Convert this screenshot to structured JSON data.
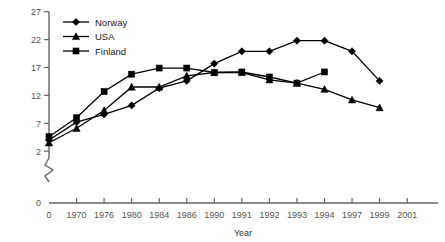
{
  "chart_data": {
    "type": "line",
    "title": "",
    "xlabel": "Year",
    "ylabel": "",
    "grid": false,
    "legend_position": "top-left-inside",
    "x_tick_labels": [
      "0",
      "1970",
      "1976",
      "1980",
      "1984",
      "1986",
      "1990",
      "1991",
      "1992",
      "1993",
      "1994",
      "1997",
      "1999",
      "2001"
    ],
    "y_tick_labels": [
      "0",
      "2",
      "7",
      "12",
      "17",
      "22",
      "27"
    ],
    "ylim": [
      2,
      27
    ],
    "y_axis_break": true,
    "y_axis_break_note": "axis broken between 0 and 2",
    "categories": [
      "1970",
      "1976",
      "1980",
      "1984",
      "1986",
      "1990",
      "1991",
      "1992",
      "1993",
      "1994",
      "1997",
      "1999"
    ],
    "series": [
      {
        "name": "Norway",
        "marker": "diamond",
        "x": [
          "0",
          "1970",
          "1976",
          "1980",
          "1984",
          "1986",
          "1990",
          "1991",
          "1992",
          "1993",
          "1994",
          "1997",
          "1999"
        ],
        "values": [
          4.0,
          7.2,
          8.6,
          10.2,
          13.3,
          14.6,
          17.7,
          19.9,
          19.9,
          21.8,
          21.8,
          19.9,
          14.6
        ]
      },
      {
        "name": "USA",
        "marker": "triangle",
        "x": [
          "0",
          "1970",
          "1976",
          "1980",
          "1984",
          "1986",
          "1990",
          "1991",
          "1992",
          "1993",
          "1994",
          "1997",
          "1999"
        ],
        "values": [
          3.5,
          6.1,
          9.3,
          13.5,
          13.5,
          15.5,
          16.1,
          16.1,
          14.8,
          14.2,
          13.1,
          11.2,
          9.8
        ]
      },
      {
        "name": "Finland",
        "marker": "square",
        "x": [
          "0",
          "1970",
          "1976",
          "1980",
          "1984",
          "1986",
          "1990",
          "1991",
          "1992",
          "1993",
          "1994"
        ],
        "values": [
          4.6,
          8.0,
          12.7,
          15.8,
          16.9,
          16.9,
          16.1,
          16.2,
          15.3,
          14.2,
          16.2
        ]
      }
    ]
  },
  "legend": {
    "items": [
      {
        "label": "Norway",
        "marker": "diamond"
      },
      {
        "label": "USA",
        "marker": "triangle"
      },
      {
        "label": "Finland",
        "marker": "square"
      }
    ]
  },
  "axis": {
    "x_title": "Year",
    "zero_label": "0",
    "y_zero_label": "0"
  }
}
